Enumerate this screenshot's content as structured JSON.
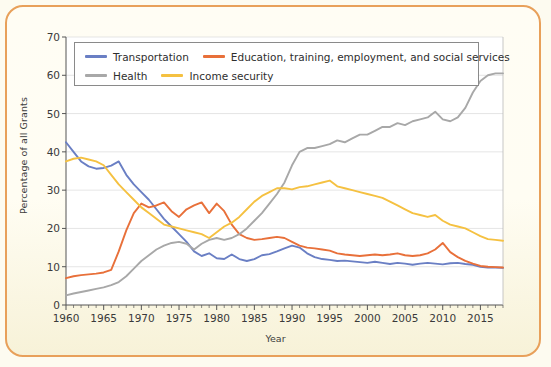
{
  "figure": {
    "background_color": "#fdfbf0",
    "border_color": "#e8a05a",
    "plot_background": "#ffffff"
  },
  "legend": {
    "position": "top-left-inside",
    "entries": [
      {
        "label": "Transportation",
        "color": "#6a7fc4"
      },
      {
        "label": "Education, training, employment, and social services",
        "color": "#e8703a"
      },
      {
        "label": "Health",
        "color": "#a8a8a8"
      },
      {
        "label": "Income security",
        "color": "#f5c141"
      }
    ]
  },
  "chart_data": {
    "type": "line",
    "title": "",
    "xlabel": "Year",
    "ylabel": "Percentage of all Grants",
    "xlim": [
      1960,
      2018
    ],
    "ylim": [
      0,
      70
    ],
    "xticks": [
      1960,
      1965,
      1970,
      1975,
      1980,
      1985,
      1990,
      1995,
      2000,
      2005,
      2010,
      2015
    ],
    "yticks": [
      0,
      10,
      20,
      30,
      40,
      50,
      60,
      70
    ],
    "grid": "horizontal",
    "legend_position": "upper left",
    "x": [
      1960,
      1961,
      1962,
      1963,
      1964,
      1965,
      1966,
      1967,
      1968,
      1969,
      1970,
      1971,
      1972,
      1973,
      1974,
      1975,
      1976,
      1977,
      1978,
      1979,
      1980,
      1981,
      1982,
      1983,
      1984,
      1985,
      1986,
      1987,
      1988,
      1989,
      1990,
      1991,
      1992,
      1993,
      1994,
      1995,
      1996,
      1997,
      1998,
      1999,
      2000,
      2001,
      2002,
      2003,
      2004,
      2005,
      2006,
      2007,
      2008,
      2009,
      2010,
      2011,
      2012,
      2013,
      2014,
      2015,
      2016,
      2017,
      2018
    ],
    "series": [
      {
        "name": "Transportation",
        "color": "#6a7fc4",
        "values": [
          42.5,
          40.0,
          37.5,
          36.2,
          35.6,
          35.8,
          36.4,
          37.5,
          34.0,
          31.5,
          29.5,
          27.5,
          25.0,
          22.5,
          20.5,
          18.5,
          16.5,
          14.0,
          12.8,
          13.5,
          12.2,
          12.0,
          13.2,
          12.0,
          11.5,
          12.0,
          13.0,
          13.3,
          14.0,
          14.8,
          15.5,
          15.0,
          13.5,
          12.5,
          12.0,
          11.8,
          11.5,
          11.6,
          11.4,
          11.2,
          11.0,
          11.3,
          11.0,
          10.7,
          11.0,
          10.8,
          10.5,
          10.8,
          11.0,
          10.8,
          10.6,
          10.9,
          11.0,
          10.7,
          10.5,
          10.0,
          9.8,
          9.8,
          9.7
        ]
      },
      {
        "name": "Education, training, employment, and social services",
        "color": "#e8703a",
        "values": [
          7.0,
          7.5,
          7.8,
          8.0,
          8.2,
          8.5,
          9.2,
          14.0,
          19.5,
          24.0,
          26.5,
          25.5,
          26.0,
          26.8,
          24.5,
          23.0,
          25.0,
          26.0,
          26.8,
          24.0,
          26.5,
          24.5,
          21.0,
          18.5,
          17.5,
          17.0,
          17.2,
          17.5,
          17.8,
          17.5,
          16.5,
          15.5,
          15.0,
          14.8,
          14.5,
          14.2,
          13.5,
          13.2,
          13.0,
          12.8,
          13.0,
          13.2,
          13.0,
          13.2,
          13.5,
          13.0,
          12.8,
          13.0,
          13.5,
          14.5,
          16.2,
          13.8,
          12.5,
          11.5,
          10.8,
          10.2,
          10.0,
          9.9,
          9.8
        ]
      },
      {
        "name": "Health",
        "color": "#a8a8a8",
        "values": [
          2.5,
          3.0,
          3.4,
          3.8,
          4.2,
          4.6,
          5.2,
          6.0,
          7.5,
          9.5,
          11.5,
          13.0,
          14.5,
          15.5,
          16.2,
          16.5,
          16.0,
          14.5,
          16.0,
          17.0,
          17.5,
          17.0,
          17.5,
          18.5,
          20.0,
          22.0,
          24.0,
          26.5,
          29.0,
          32.0,
          36.5,
          40.0,
          41.0,
          41.0,
          41.5,
          42.0,
          43.0,
          42.5,
          43.5,
          44.5,
          44.5,
          45.5,
          46.5,
          46.5,
          47.5,
          47.0,
          48.0,
          48.5,
          49.0,
          50.5,
          48.5,
          48.0,
          49.0,
          51.5,
          55.5,
          58.5,
          60.0,
          60.5,
          60.5
        ]
      },
      {
        "name": "Income security",
        "color": "#f5c141",
        "values": [
          37.5,
          38.2,
          38.5,
          38.0,
          37.5,
          36.5,
          34.0,
          31.5,
          29.5,
          27.5,
          25.5,
          24.0,
          22.5,
          21.0,
          20.5,
          20.0,
          19.5,
          19.0,
          18.5,
          17.5,
          19.0,
          20.5,
          21.5,
          23.0,
          25.0,
          27.0,
          28.5,
          29.5,
          30.5,
          30.5,
          30.2,
          30.8,
          31.0,
          31.5,
          32.0,
          32.5,
          31.0,
          30.5,
          30.0,
          29.5,
          29.0,
          28.5,
          28.0,
          27.0,
          26.0,
          25.0,
          24.0,
          23.5,
          23.0,
          23.5,
          22.0,
          21.0,
          20.5,
          20.0,
          19.0,
          18.0,
          17.2,
          17.0,
          16.8
        ]
      }
    ]
  }
}
